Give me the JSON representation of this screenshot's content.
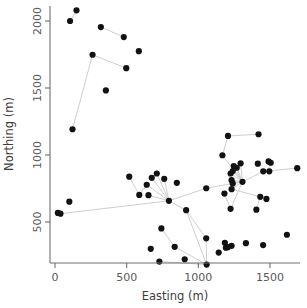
{
  "chart_data": {
    "type": "scatter",
    "title": "",
    "xlabel": "Easting (m)",
    "ylabel": "Northing (m)",
    "xlim": [
      -40,
      1760
    ],
    "ylim": [
      120,
      2130
    ],
    "xticks": [
      0,
      500,
      1000,
      1500
    ],
    "yticks": [
      500,
      1000,
      1500,
      2000
    ],
    "xticklabels": [
      "0",
      "500",
      "1000",
      "1500"
    ],
    "yticklabels": [
      "500",
      "1000",
      "1500",
      "2000"
    ],
    "grid": false,
    "legend": null,
    "point_color": "#121212",
    "edge_color": "#cfcfcf",
    "axis_color": "#6e6e6e",
    "marker_size": 3.1,
    "points": [
      {
        "id": 0,
        "x": 105,
        "y": 2000
      },
      {
        "id": 1,
        "x": 150,
        "y": 2080
      },
      {
        "id": 2,
        "x": 320,
        "y": 1955
      },
      {
        "id": 3,
        "x": 480,
        "y": 1880
      },
      {
        "id": 4,
        "x": 585,
        "y": 1775
      },
      {
        "id": 5,
        "x": 262,
        "y": 1748
      },
      {
        "id": 6,
        "x": 497,
        "y": 1648
      },
      {
        "id": 7,
        "x": 355,
        "y": 1482
      },
      {
        "id": 8,
        "x": 122,
        "y": 1192
      },
      {
        "id": 9,
        "x": 1207,
        "y": 1142
      },
      {
        "id": 10,
        "x": 1420,
        "y": 1155
      },
      {
        "id": 11,
        "x": 1168,
        "y": 998
      },
      {
        "id": 12,
        "x": 1490,
        "y": 952
      },
      {
        "id": 13,
        "x": 1505,
        "y": 942
      },
      {
        "id": 14,
        "x": 1295,
        "y": 938
      },
      {
        "id": 15,
        "x": 1415,
        "y": 935
      },
      {
        "id": 16,
        "x": 1247,
        "y": 918
      },
      {
        "id": 17,
        "x": 1268,
        "y": 905
      },
      {
        "id": 18,
        "x": 1690,
        "y": 902
      },
      {
        "id": 19,
        "x": 1495,
        "y": 878
      },
      {
        "id": 20,
        "x": 1240,
        "y": 880
      },
      {
        "id": 21,
        "x": 1453,
        "y": 878
      },
      {
        "id": 22,
        "x": 710,
        "y": 862
      },
      {
        "id": 23,
        "x": 1225,
        "y": 862
      },
      {
        "id": 24,
        "x": 518,
        "y": 838
      },
      {
        "id": 25,
        "x": 675,
        "y": 830
      },
      {
        "id": 26,
        "x": 762,
        "y": 822
      },
      {
        "id": 27,
        "x": 1232,
        "y": 812
      },
      {
        "id": 28,
        "x": 1308,
        "y": 800
      },
      {
        "id": 29,
        "x": 850,
        "y": 792
      },
      {
        "id": 30,
        "x": 1240,
        "y": 788
      },
      {
        "id": 31,
        "x": 640,
        "y": 778
      },
      {
        "id": 32,
        "x": 1055,
        "y": 752
      },
      {
        "id": 33,
        "x": 1182,
        "y": 712
      },
      {
        "id": 34,
        "x": 1232,
        "y": 745
      },
      {
        "id": 35,
        "x": 1432,
        "y": 688
      },
      {
        "id": 36,
        "x": 1475,
        "y": 672
      },
      {
        "id": 37,
        "x": 588,
        "y": 702
      },
      {
        "id": 38,
        "x": 652,
        "y": 700
      },
      {
        "id": 39,
        "x": 100,
        "y": 652
      },
      {
        "id": 40,
        "x": 795,
        "y": 658
      },
      {
        "id": 41,
        "x": 1225,
        "y": 598
      },
      {
        "id": 42,
        "x": 1405,
        "y": 592
      },
      {
        "id": 43,
        "x": 20,
        "y": 568
      },
      {
        "id": 44,
        "x": 38,
        "y": 562
      },
      {
        "id": 45,
        "x": 915,
        "y": 588
      },
      {
        "id": 46,
        "x": 742,
        "y": 452
      },
      {
        "id": 47,
        "x": 1618,
        "y": 405
      },
      {
        "id": 48,
        "x": 1055,
        "y": 378
      },
      {
        "id": 49,
        "x": 1185,
        "y": 345
      },
      {
        "id": 50,
        "x": 1332,
        "y": 342
      },
      {
        "id": 51,
        "x": 1452,
        "y": 328
      },
      {
        "id": 52,
        "x": 1232,
        "y": 322
      },
      {
        "id": 53,
        "x": 1205,
        "y": 312
      },
      {
        "id": 54,
        "x": 1192,
        "y": 308
      },
      {
        "id": 55,
        "x": 835,
        "y": 315
      },
      {
        "id": 56,
        "x": 668,
        "y": 300
      },
      {
        "id": 57,
        "x": 1142,
        "y": 272
      },
      {
        "id": 58,
        "x": 905,
        "y": 222
      },
      {
        "id": 59,
        "x": 728,
        "y": 205
      },
      {
        "id": 60,
        "x": 1058,
        "y": 182
      }
    ],
    "edges": [
      {
        "from": 0,
        "to": 1
      },
      {
        "from": 2,
        "to": 3
      },
      {
        "from": 5,
        "to": 6
      },
      {
        "from": 5,
        "to": 8
      },
      {
        "from": 9,
        "to": 10
      },
      {
        "from": 9,
        "to": 11
      },
      {
        "from": 11,
        "to": 28
      },
      {
        "from": 14,
        "to": 28
      },
      {
        "from": 16,
        "to": 28
      },
      {
        "from": 17,
        "to": 28
      },
      {
        "from": 20,
        "to": 28
      },
      {
        "from": 23,
        "to": 28
      },
      {
        "from": 27,
        "to": 28
      },
      {
        "from": 30,
        "to": 28
      },
      {
        "from": 21,
        "to": 18
      },
      {
        "from": 21,
        "to": 28
      },
      {
        "from": 19,
        "to": 13
      },
      {
        "from": 28,
        "to": 32
      },
      {
        "from": 28,
        "to": 34
      },
      {
        "from": 28,
        "to": 41
      },
      {
        "from": 34,
        "to": 35
      },
      {
        "from": 35,
        "to": 36
      },
      {
        "from": 35,
        "to": 42
      },
      {
        "from": 33,
        "to": 41
      },
      {
        "from": 32,
        "to": 40
      },
      {
        "from": 40,
        "to": 22
      },
      {
        "from": 40,
        "to": 25
      },
      {
        "from": 40,
        "to": 26
      },
      {
        "from": 40,
        "to": 31
      },
      {
        "from": 40,
        "to": 38
      },
      {
        "from": 40,
        "to": 45
      },
      {
        "from": 40,
        "to": 44
      },
      {
        "from": 22,
        "to": 25
      },
      {
        "from": 24,
        "to": 37
      },
      {
        "from": 37,
        "to": 31
      },
      {
        "from": 45,
        "to": 48
      },
      {
        "from": 45,
        "to": 60
      },
      {
        "from": 46,
        "to": 55
      },
      {
        "from": 55,
        "to": 60
      },
      {
        "from": 48,
        "to": 60
      },
      {
        "from": 59,
        "to": 60
      }
    ]
  },
  "axes": {
    "xlabel": "Easting (m)",
    "ylabel": "Northing (m)",
    "xtick_labels": [
      "0",
      "500",
      "1000",
      "1500"
    ],
    "ytick_labels": [
      "500",
      "1000",
      "1500",
      "2000"
    ]
  }
}
